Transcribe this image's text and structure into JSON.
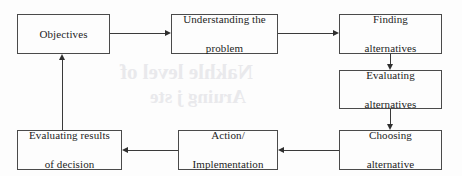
{
  "diagram": {
    "type": "flowchart",
    "title_visible": false,
    "style": {
      "border_color": "#4a4a4a",
      "arrow_color": "#2f2f2f",
      "text_color": "#1d1d1d",
      "background": "#fdfdfd"
    },
    "nodes": [
      {
        "id": "objectives",
        "label": "Objectives",
        "lines": [
          "Objectives"
        ],
        "x": 17,
        "y": 14,
        "w": 93,
        "h": 40
      },
      {
        "id": "understanding",
        "label": "Understanding the problem",
        "lines": [
          "Understanding the",
          "problem"
        ],
        "x": 171,
        "y": 14,
        "w": 107,
        "h": 40
      },
      {
        "id": "finding",
        "label": "Finding alternatives",
        "lines": [
          "Finding",
          "alternatives"
        ],
        "x": 339,
        "y": 14,
        "w": 103,
        "h": 40
      },
      {
        "id": "evaluating_alts",
        "label": "Evaluating alternatives",
        "lines": [
          "Evaluating",
          "alternatives"
        ],
        "x": 339,
        "y": 70,
        "w": 103,
        "h": 39
      },
      {
        "id": "choosing",
        "label": "Choosing alternative",
        "lines": [
          "Choosing",
          "alternative"
        ],
        "x": 339,
        "y": 130,
        "w": 103,
        "h": 40
      },
      {
        "id": "action",
        "label": "Action/ Implementation",
        "lines": [
          "Action/",
          "Implementation"
        ],
        "x": 178,
        "y": 130,
        "w": 100,
        "h": 40
      },
      {
        "id": "evaluating_results",
        "label": "Evaluating results of decision",
        "lines": [
          "Evaluating results",
          "of decision"
        ],
        "x": 17,
        "y": 130,
        "w": 105,
        "h": 40
      }
    ],
    "edges": [
      {
        "id": "e1",
        "from": "objectives",
        "to": "understanding",
        "direction": "right"
      },
      {
        "id": "e2",
        "from": "understanding",
        "to": "finding",
        "direction": "right"
      },
      {
        "id": "e3",
        "from": "finding",
        "to": "evaluating_alts",
        "direction": "down"
      },
      {
        "id": "e4",
        "from": "evaluating_alts",
        "to": "choosing",
        "direction": "down"
      },
      {
        "id": "e5",
        "from": "choosing",
        "to": "action",
        "direction": "left"
      },
      {
        "id": "e6",
        "from": "action",
        "to": "evaluating_results",
        "direction": "left"
      },
      {
        "id": "e7",
        "from": "evaluating_results",
        "to": "objectives",
        "direction": "up"
      }
    ],
    "scan_bleed": {
      "line1": "Nakhle level of",
      "line2": "Aruing  j  ste"
    }
  }
}
